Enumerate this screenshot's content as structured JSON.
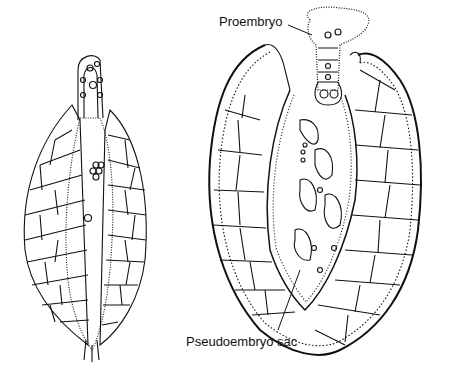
{
  "figure": {
    "labels": {
      "proembryo": "Proembryo",
      "pseudoembryo_sac": "Pseudoembryo sac"
    },
    "colors": {
      "ink": "#111111",
      "background": "#ffffff"
    }
  }
}
